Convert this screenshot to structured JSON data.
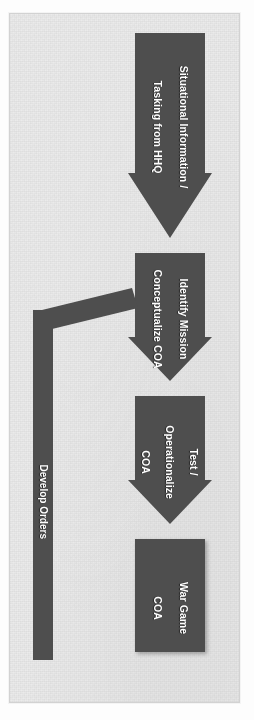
{
  "document": {
    "type": "flowchart",
    "orientation": "rotated-90",
    "background_color": "#ebebeb",
    "shape_color": "#4e4e4e",
    "text_color": "#ffffff",
    "border_color": "#d2d2d2"
  },
  "nodes": [
    {
      "id": "situational-information",
      "shape": "block-arrow",
      "lines": [
        "Situational Information /",
        "Tasking from HHQ"
      ],
      "text": "Situational Information / Tasking from HHQ"
    },
    {
      "id": "identify-mission",
      "shape": "block-arrow",
      "lines": [
        "Identify Mission",
        "Conceptualize COA"
      ],
      "text": "Identify Mission Conceptualize COA"
    },
    {
      "id": "test-operationalize",
      "shape": "block-arrow",
      "lines": [
        "Test /",
        "Operationalize",
        "COA"
      ],
      "text": "Test / Operationalize COA"
    },
    {
      "id": "war-game",
      "shape": "rectangle",
      "lines": [
        "War Game",
        "COA"
      ],
      "text": "War Game COA"
    }
  ],
  "connectors": [
    {
      "id": "develop-orders",
      "shape": "elbow-bar",
      "label": "Develop Orders",
      "from": "war-game-area",
      "to": "identify-mission"
    }
  ]
}
